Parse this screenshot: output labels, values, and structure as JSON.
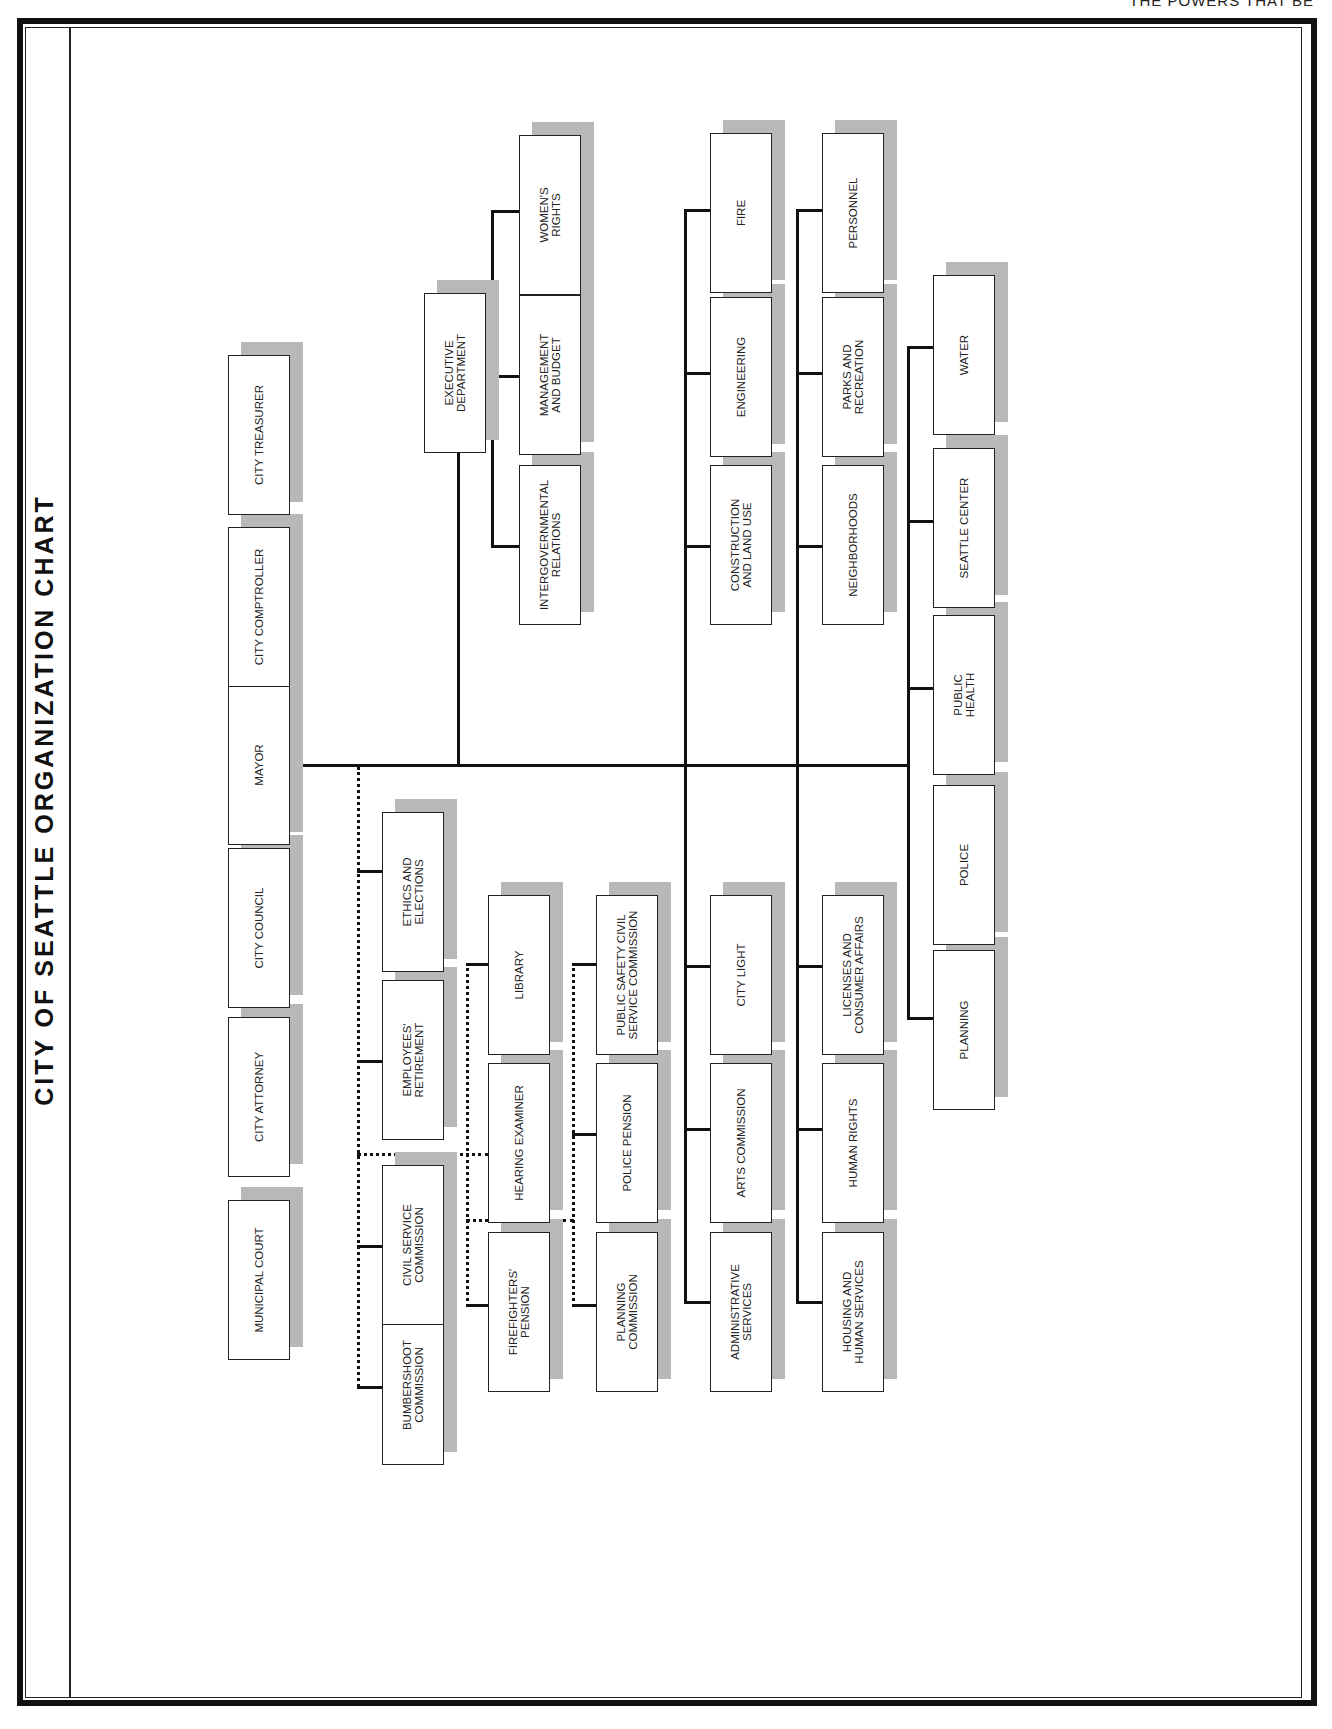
{
  "page": {
    "running_head": "THE POWERS THAT BE",
    "title": "CITY OF SEATTLE ORGANIZATION CHART"
  },
  "officials": [
    {
      "id": "municipal-court",
      "label": "MUNICIPAL COURT"
    },
    {
      "id": "city-attorney",
      "label": "CITY ATTORNEY"
    },
    {
      "id": "city-council",
      "label": "CITY COUNCIL"
    },
    {
      "id": "mayor",
      "label": "MAYOR"
    },
    {
      "id": "city-comptroller",
      "label": "CITY COMPTROLLER"
    },
    {
      "id": "city-treasurer",
      "label": "CITY TREASURER"
    }
  ],
  "executive": {
    "department": {
      "label": "EXECUTIVE\nDEPARTMENT"
    },
    "offices": [
      {
        "label": "INTERGOVERNMENTAL\nRELATIONS"
      },
      {
        "label": "MANAGEMENT\nAND BUDGET"
      },
      {
        "label": "WOMEN'S\nRIGHTS"
      }
    ]
  },
  "commissions_col1": [
    {
      "label": "BUMBERSHOOT\nCOMMISSION"
    },
    {
      "label": "CIVIL SERVICE\nCOMMISSION"
    },
    {
      "label": "EMPLOYEES'\nRETIREMENT"
    },
    {
      "label": "ETHICS AND\nELECTIONS"
    }
  ],
  "commissions_col2": [
    {
      "label": "FIREFIGHTERS'\nPENSION"
    },
    {
      "label": "HEARING EXAMINER"
    },
    {
      "label": "LIBRARY"
    }
  ],
  "commissions_col3": [
    {
      "label": "PLANNING\nCOMMISSION"
    },
    {
      "label": "POLICE PENSION"
    },
    {
      "label": "PUBLIC SAFETY CIVIL\nSERVICE COMMISSION"
    }
  ],
  "departments_col1_upper": [
    {
      "label": "CONSTRUCTION\nAND LAND USE"
    },
    {
      "label": "ENGINEERING"
    },
    {
      "label": "FIRE"
    }
  ],
  "departments_col1_lower": [
    {
      "label": "ADMINISTRATIVE\nSERVICES"
    },
    {
      "label": "ARTS COMMISSION"
    },
    {
      "label": "CITY LIGHT"
    }
  ],
  "departments_col2_upper": [
    {
      "label": "NEIGHBORHOODS"
    },
    {
      "label": "PARKS AND\nRECREATION"
    },
    {
      "label": "PERSONNEL"
    }
  ],
  "departments_col2_lower": [
    {
      "label": "HOUSING AND\nHUMAN SERVICES"
    },
    {
      "label": "HUMAN RIGHTS"
    },
    {
      "label": "LICENSES AND\nCONSUMER AFFAIRS"
    }
  ],
  "departments_col3": [
    {
      "label": "PLANNING"
    },
    {
      "label": "POLICE"
    },
    {
      "label": "PUBLIC\nHEALTH"
    },
    {
      "label": "SEATTLE CENTER"
    },
    {
      "label": "WATER"
    }
  ],
  "colors": {
    "line": "#111111",
    "box_border": "#222222",
    "shadow": "#b8b8b8",
    "background": "#ffffff"
  }
}
